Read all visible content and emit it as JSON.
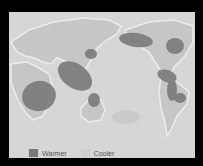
{
  "map": {
    "colors": {
      "frame": "#000000",
      "ocean": "#d6d6d6",
      "land": "#c6c6c6",
      "coast": "#ececec",
      "warmer": "#7a7a7a",
      "cooler": "#c9c9c9"
    },
    "regions": [
      {
        "type": "warmer",
        "area": "southern-africa"
      },
      {
        "type": "warmer",
        "area": "indonesia-southeast-asia"
      },
      {
        "type": "warmer",
        "area": "japan"
      },
      {
        "type": "warmer",
        "area": "northern-australia"
      },
      {
        "type": "warmer",
        "area": "alaska-western-canada"
      },
      {
        "type": "warmer",
        "area": "eastern-canada"
      },
      {
        "type": "warmer",
        "area": "central-america"
      },
      {
        "type": "warmer",
        "area": "northern-south-america"
      },
      {
        "type": "warmer",
        "area": "southeastern-brazil"
      },
      {
        "type": "cooler",
        "area": "south-central-pacific"
      }
    ]
  },
  "legend": {
    "items": [
      {
        "label": "Warmer",
        "color": "#7a7a7a"
      },
      {
        "label": "Cooler",
        "color": "#cdcdcd"
      }
    ]
  }
}
